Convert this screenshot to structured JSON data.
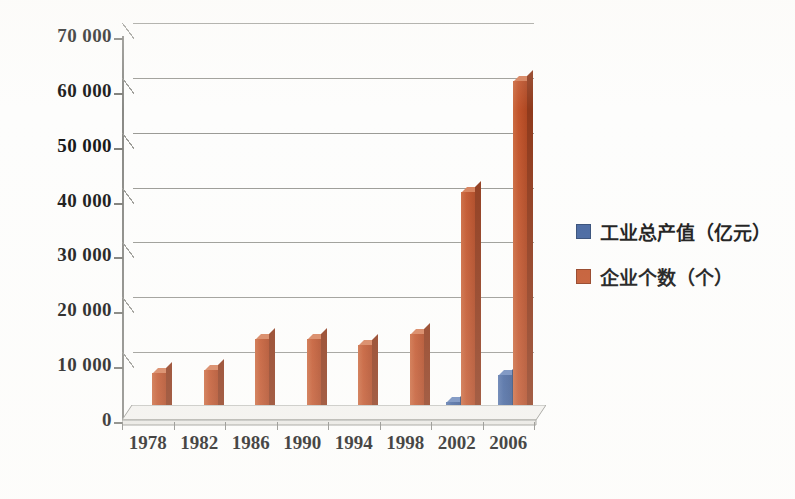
{
  "chart_data": {
    "type": "bar",
    "title": "",
    "xlabel": "",
    "ylabel": "",
    "categories": [
      "1978",
      "1982",
      "1986",
      "1990",
      "1994",
      "1998",
      "2002",
      "2006"
    ],
    "series": [
      {
        "name": "工业总产值（亿元）",
        "color": "#42639e",
        "values": [
          200,
          300,
          500,
          600,
          1800,
          1000,
          3700,
          8500
        ]
      },
      {
        "name": "企业个数（个）",
        "color": "#c2552c",
        "values": [
          8900,
          9400,
          15100,
          15100,
          14000,
          16100,
          42000,
          62100
        ]
      }
    ],
    "ylim": [
      0,
      70000
    ],
    "ytick_step": 10000,
    "ytick_labels": [
      "0",
      "10 000",
      "20 000",
      "30 000",
      "40 000",
      "50 000",
      "60 000",
      "70 000"
    ],
    "ytick_values": [
      0,
      10000,
      20000,
      30000,
      40000,
      50000,
      60000,
      70000
    ],
    "grid": true,
    "legend_position": "right",
    "style": "3d-column"
  },
  "legend": {
    "items": [
      {
        "label": "工业总产值（亿元）",
        "swatch": "blue"
      },
      {
        "label": "企业个数（个）",
        "swatch": "orange"
      }
    ]
  },
  "colors": {
    "series_blue": "#42639e",
    "series_orange": "#c2552c",
    "axis": "#8a8a86",
    "grid": "#9a9a95",
    "text": "#151515",
    "background": "#fdfdfc"
  }
}
